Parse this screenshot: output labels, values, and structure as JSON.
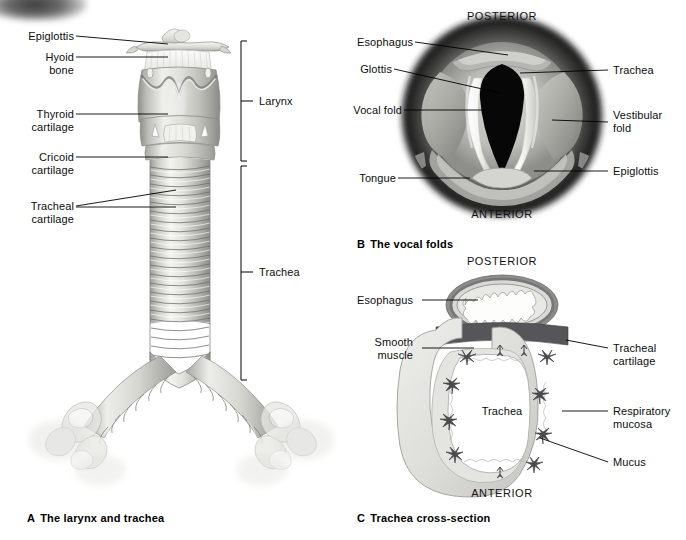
{
  "figure": {
    "title_alt": "Respiratory anatomy: larynx, trachea, vocal folds and trachea cross-section"
  },
  "panels": [
    {
      "id": "A",
      "letter": "A",
      "caption": "The larynx and trachea",
      "labels_left": [
        {
          "name": "epiglottis",
          "text": "Epiglottis"
        },
        {
          "name": "hyoid-bone",
          "text": "Hyoid\nbone"
        },
        {
          "name": "thyroid-cartilage",
          "text": "Thyroid\ncartilage"
        },
        {
          "name": "cricoid-cartilage",
          "text": "Cricoid\ncartilage"
        },
        {
          "name": "tracheal-cartilage",
          "text": "Tracheal\ncartilage"
        }
      ],
      "labels_right": [
        {
          "name": "larynx",
          "text": "Larynx"
        },
        {
          "name": "trachea",
          "text": "Trachea"
        }
      ]
    },
    {
      "id": "B",
      "letter": "B",
      "caption": "The vocal folds",
      "orientation_top": "POSTERIOR",
      "orientation_bottom": "ANTERIOR",
      "labels_left": [
        {
          "name": "esophagus",
          "text": "Esophagus"
        },
        {
          "name": "glottis",
          "text": "Glottis"
        },
        {
          "name": "vocal-fold",
          "text": "Vocal fold"
        },
        {
          "name": "tongue",
          "text": "Tongue"
        }
      ],
      "labels_right": [
        {
          "name": "trachea",
          "text": "Trachea"
        },
        {
          "name": "vestibular-fold",
          "text": "Vestibular\nfold"
        },
        {
          "name": "epiglottis",
          "text": "Epiglottis"
        }
      ]
    },
    {
      "id": "C",
      "letter": "C",
      "caption": "Trachea cross-section",
      "orientation_top": "POSTERIOR",
      "orientation_bottom": "ANTERIOR",
      "labels_left": [
        {
          "name": "esophagus",
          "text": "Esophagus"
        },
        {
          "name": "smooth-muscle",
          "text": "Smooth\nmuscle"
        }
      ],
      "labels_right": [
        {
          "name": "tracheal-cartilage",
          "text": "Tracheal\ncartilage"
        },
        {
          "name": "respiratory-mucosa",
          "text": "Respiratory\nmucosa"
        },
        {
          "name": "mucus",
          "text": "Mucus"
        }
      ],
      "labels_inner": [
        {
          "name": "trachea",
          "text": "Trachea"
        }
      ]
    }
  ],
  "colors": {
    "background": "#ffffff",
    "label_text": "#0d0d0d",
    "leader_line": "#000000",
    "cartilage_light": "#e8e8e6",
    "cartilage_mid": "#c8c8c4",
    "cartilage_dark": "#9a9a96",
    "mucosa": "#d9d9d4",
    "muscle_dark": "#5a5a58",
    "glottis_black": "#0a0a0a"
  }
}
